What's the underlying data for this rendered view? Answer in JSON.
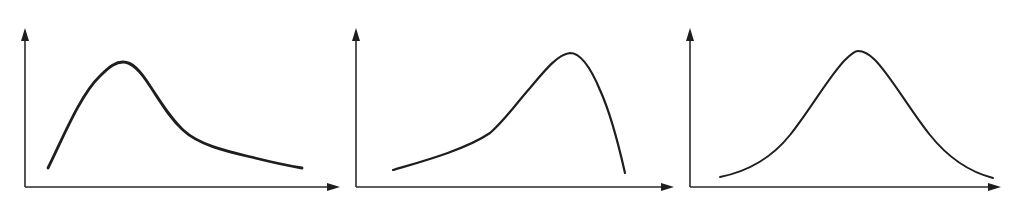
{
  "diagram": {
    "colors": {
      "background": "#ffffff",
      "ink": "#1e1e1e"
    },
    "panels": [
      {
        "id": "positive-skew",
        "shape": "right-skewed (positively skewed) distribution",
        "origin": [
          25,
          187
        ],
        "y_axis_top": [
          25,
          28
        ],
        "x_axis_end": [
          340,
          187
        ],
        "curve_path": "M48,168 C62,140 80,95 100,76 C110,66 116,62 123,62 C132,62 140,70 150,86 C162,104 170,118 183,130 C200,146 230,152 255,158 C275,163 290,166 302,168",
        "stroke_width": 2.8
      },
      {
        "id": "negative-skew",
        "shape": "left-skewed (negatively skewed) distribution",
        "origin": [
          356,
          187
        ],
        "y_axis_top": [
          356,
          28
        ],
        "x_axis_end": [
          674,
          187
        ],
        "curve_path": "M393,170 C420,162 465,150 490,133 C505,120 515,105 530,88 C545,70 558,54 570,53 C580,53 590,66 600,90 C610,112 618,142 625,173",
        "stroke_width": 2.2
      },
      {
        "id": "symmetric",
        "shape": "symmetric (normal / bell-shaped) distribution",
        "origin": [
          690,
          187
        ],
        "y_axis_top": [
          690,
          28
        ],
        "x_axis_end": [
          1001,
          187
        ],
        "curve_path": "M720,177 C745,172 770,160 790,135 C810,110 830,75 845,60 C852,53 856,51 858,51 C862,51 868,53 875,60 C890,75 910,110 930,135 C950,160 970,172 993,178",
        "stroke_width": 2.0
      }
    ]
  }
}
